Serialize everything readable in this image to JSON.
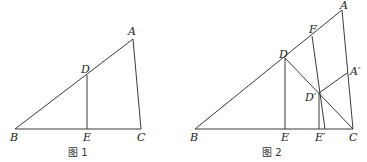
{
  "figure1": {
    "caption": "图 1",
    "points": {
      "A": {
        "label": "A",
        "x": 133,
        "y": 39
      },
      "B": {
        "label": "B",
        "x": 15,
        "y": 129
      },
      "C": {
        "label": "C",
        "x": 141,
        "y": 129
      },
      "D": {
        "label": "D",
        "x": 87,
        "y": 75
      },
      "E": {
        "label": "E",
        "x": 87,
        "y": 129
      }
    },
    "segments": [
      "AB",
      "BC",
      "CA",
      "DE"
    ]
  },
  "figure2": {
    "caption": "图 2",
    "points": {
      "A": {
        "label": "A",
        "x": 342,
        "y": 10
      },
      "B": {
        "label": "B",
        "x": 195,
        "y": 129
      },
      "C": {
        "label": "C",
        "x": 353,
        "y": 129
      },
      "D": {
        "label": "D",
        "x": 285,
        "y": 58
      },
      "E": {
        "label": "E",
        "x": 285,
        "y": 129
      },
      "F": {
        "label": "F",
        "x": 312,
        "y": 36
      },
      "Dp": {
        "label": "D′",
        "x": 319,
        "y": 93
      },
      "Ap": {
        "label": "A′",
        "x": 347,
        "y": 73
      },
      "Ep": {
        "label": "E′",
        "x": 319,
        "y": 129
      }
    },
    "segments": [
      "AB",
      "BC",
      "CA",
      "DE",
      "DC",
      "FE'",
      "D'E'",
      "D'A'"
    ]
  }
}
